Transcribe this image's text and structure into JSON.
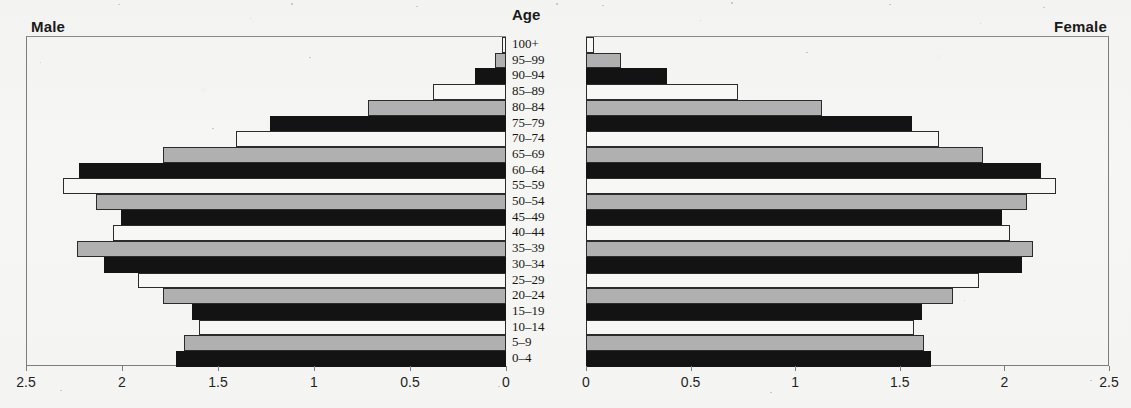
{
  "panels": {
    "left_label": "Male",
    "right_label": "Female",
    "age_column_header": "Age"
  },
  "axis": {
    "left_ticks": [
      "2.5",
      "2",
      "1.5",
      "1",
      "0.5",
      "0"
    ],
    "right_ticks": [
      "0",
      "0.5",
      "1",
      "1.5",
      "2",
      "2.5"
    ],
    "min": 0,
    "max": 2.5,
    "step": 0.5
  },
  "colors": {
    "bar_black": "#131313",
    "bar_gray": "#b0b0b0",
    "bar_white": "#f7f7f5",
    "outline": "#2b2b2b",
    "frame": "#7d7d7d",
    "paper": "#f4f4f2",
    "text": "#161616"
  },
  "chart_data": {
    "type": "bar",
    "title": "",
    "subtype": "population-pyramid",
    "xlabel": "",
    "ylabel": "Age",
    "xlim": [
      0,
      2.5
    ],
    "grid": false,
    "legend": "none",
    "orientation": "horizontal",
    "categories": [
      "100+",
      "95–99",
      "90–94",
      "85–89",
      "80–84",
      "75–79",
      "70–74",
      "65–69",
      "60–64",
      "55–59",
      "50–54",
      "45–49",
      "40–44",
      "35–39",
      "30–34",
      "25–29",
      "20–24",
      "15–19",
      "10–14",
      "5–9",
      "0–4"
    ],
    "fills": [
      "white",
      "gray",
      "black",
      "white",
      "gray",
      "black",
      "white",
      "gray",
      "black",
      "white",
      "gray",
      "black",
      "white",
      "gray",
      "black",
      "white",
      "gray",
      "black",
      "white",
      "gray",
      "black"
    ],
    "series": [
      {
        "name": "Male",
        "side": "left",
        "values": [
          0.02,
          0.06,
          0.16,
          0.38,
          0.72,
          1.23,
          1.41,
          1.79,
          2.23,
          2.31,
          2.14,
          2.01,
          2.05,
          2.24,
          2.1,
          1.92,
          1.79,
          1.64,
          1.6,
          1.68,
          1.72
        ]
      },
      {
        "name": "Female",
        "side": "right",
        "values": [
          0.04,
          0.17,
          0.39,
          0.73,
          1.13,
          1.56,
          1.69,
          1.9,
          2.18,
          2.25,
          2.11,
          1.99,
          2.03,
          2.14,
          2.09,
          1.88,
          1.76,
          1.61,
          1.57,
          1.62,
          1.65
        ]
      }
    ]
  }
}
